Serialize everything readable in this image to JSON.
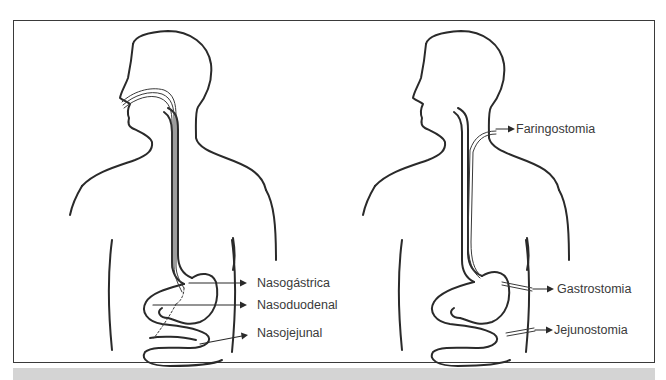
{
  "figure": {
    "left_panel": {
      "title": "Nasal routes",
      "labels": [
        {
          "id": "nasogastric",
          "text": "Nasogástrica"
        },
        {
          "id": "nasoduodenal",
          "text": "Nasoduodenal"
        },
        {
          "id": "nasojejunal",
          "text": "Nasojejunal"
        }
      ]
    },
    "right_panel": {
      "title": "Ostomy routes",
      "labels": [
        {
          "id": "pharyngostomy",
          "text": "Faringostomia"
        },
        {
          "id": "gastrostomy",
          "text": "Gastrostomia"
        },
        {
          "id": "jejunostomy",
          "text": "Jejunostomia"
        }
      ]
    },
    "colors": {
      "stroke": "#2a2a2a",
      "text": "#3a3a3a",
      "band": "#d4d4d4"
    }
  }
}
